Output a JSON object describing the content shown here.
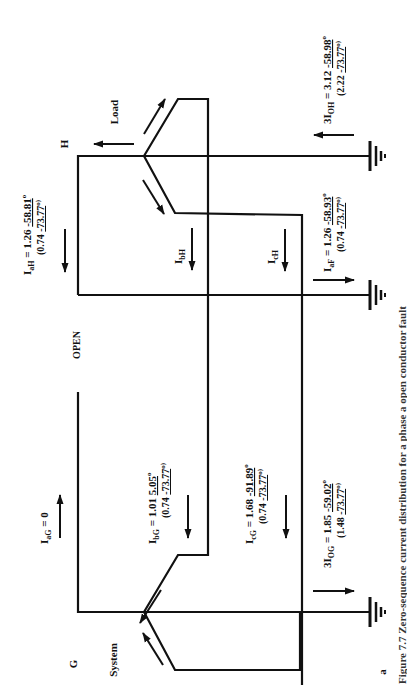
{
  "figure": {
    "panel_label": "a",
    "bus_labels": {
      "left_bus": "G",
      "right_bus": "H"
    },
    "side_labels": {
      "system": "System",
      "load": "Load",
      "open": "OPEN"
    },
    "currents": {
      "I_aH": {
        "main": "I",
        "sub": "aH",
        "value": " = 1.26 ",
        "angle": "-58.81",
        "deg": "o",
        "paren_mag": "(0.74 ",
        "paren_angle": "-73.77",
        "paren_close": "o)"
      },
      "I_bH": {
        "main": "I",
        "sub": "bH"
      },
      "I_cH": {
        "main": "I",
        "sub": "cH"
      },
      "I_aF": {
        "main": "I",
        "sub": "aF",
        "value": " = 1.26 ",
        "angle": "-58.93",
        "deg": "o",
        "paren_mag": "(0.74 ",
        "paren_angle": "-73.77",
        "paren_close": "o)"
      },
      "3I_OH": {
        "main": "3I",
        "sub": "OH",
        "value": " = 3.12 ",
        "angle": "-58.98",
        "deg": "o",
        "paren_mag": "(2.22 ",
        "paren_angle": "-73.77",
        "paren_close": "o)"
      },
      "I_aG": {
        "main": "I",
        "sub": "aG",
        "value": " = 0"
      },
      "I_bG": {
        "main": "I",
        "sub": "bG",
        "value": " = 1.01 ",
        "angle": "5.05",
        "deg": "o",
        "paren_mag": "(0.74 ",
        "paren_angle": "-73.77",
        "paren_close": "o)"
      },
      "I_cG": {
        "main": "I",
        "sub": "cG",
        "value": " = 1.68 ",
        "angle": "-91.89",
        "deg": "o",
        "paren_mag": "(0.74 ",
        "paren_angle": "-73.77",
        "paren_close": "o)"
      },
      "3I_OG": {
        "main": "3I",
        "sub": "OG",
        "value": " = 1.85 ",
        "angle": "-59.02",
        "deg": "o",
        "paren_mag": "(1.48 ",
        "paren_angle": "-73.77",
        "paren_close": "o)"
      }
    },
    "caption_partial": "Figure 7.7  Zero-sequence current distribution for a phase a open conductor fault"
  }
}
